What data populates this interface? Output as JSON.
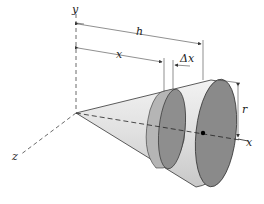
{
  "figure": {
    "type": "cone-volume-slice diagram",
    "labels": {
      "y_axis": "y",
      "x_axis": "x",
      "z_axis": "z",
      "height": "h",
      "slice_position": "x",
      "slice_thickness": "Δx",
      "radius": "r"
    },
    "colors": {
      "cone_body": "#e2e2e2",
      "cone_shadow": "#c4c4c4",
      "base_face": "#8a8a8a",
      "slice_face": "#909090",
      "slice_band": "#b8b8b8",
      "lines": "#333333"
    }
  }
}
